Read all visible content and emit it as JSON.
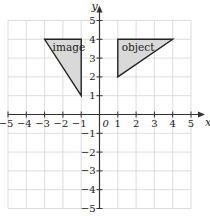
{
  "diagram": {
    "type": "coordinate-grid-reflection",
    "axes": {
      "x_label": "x",
      "y_label": "y",
      "origin_label": "0",
      "x_range": [
        -5,
        5
      ],
      "y_range": [
        -5,
        5
      ],
      "x_ticks": [
        "−5",
        "−4",
        "−3",
        "−2",
        "−1",
        "1",
        "2",
        "3",
        "4",
        "5"
      ],
      "y_ticks": [
        "5",
        "4",
        "3",
        "2",
        "1",
        "−1",
        "−2",
        "−3",
        "−4",
        "−5"
      ]
    },
    "shapes": [
      {
        "name": "object",
        "label": "object",
        "vertices": [
          [
            1,
            4
          ],
          [
            4,
            4
          ],
          [
            1,
            2
          ]
        ],
        "fill": "#d9d9d9"
      },
      {
        "name": "image",
        "label": "image",
        "vertices": [
          [
            -3,
            4
          ],
          [
            -1,
            4
          ],
          [
            -1,
            1
          ]
        ],
        "fill": "#d9d9d9"
      }
    ],
    "colors": {
      "grid": "#d4d4d4",
      "axis": "#333333",
      "outline": "#222222"
    }
  }
}
